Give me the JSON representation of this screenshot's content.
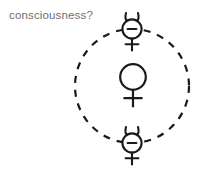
{
  "canvas": {
    "width": 210,
    "height": 176,
    "background_color": "#ffffff"
  },
  "caption": {
    "text": "consciousness?",
    "color": "#6f6f6f",
    "font_size_px": 11.5,
    "x": 9,
    "y": 9
  },
  "diagram": {
    "type": "orbit-diagram",
    "stroke_color": "#1a1a1a",
    "stroke_width": 2,
    "orbit": {
      "name": "dashed-orbit-circle",
      "center_x": 132,
      "center_y": 86,
      "radius": 57,
      "dash_pattern": "7 7",
      "style": "dashed"
    },
    "nodes": [
      {
        "id": "top-mercury",
        "symbol_name": "mercury-symbol-with-minus",
        "unicode": "☿",
        "label": "−",
        "has_minus": true,
        "has_horns": true,
        "center_x": 132,
        "center_y": 29,
        "circle_radius": 10,
        "position": "orbit-top"
      },
      {
        "id": "center-venus",
        "symbol_name": "venus-symbol",
        "unicode": "♀",
        "label": "",
        "has_minus": false,
        "has_horns": false,
        "center_x": 133,
        "center_y": 77,
        "circle_radius": 13,
        "position": "orbit-center"
      },
      {
        "id": "bottom-mercury",
        "symbol_name": "mercury-symbol-with-minus",
        "unicode": "☿",
        "label": "−",
        "has_minus": true,
        "has_horns": true,
        "center_x": 132,
        "center_y": 143,
        "circle_radius": 10,
        "position": "orbit-bottom"
      }
    ]
  }
}
